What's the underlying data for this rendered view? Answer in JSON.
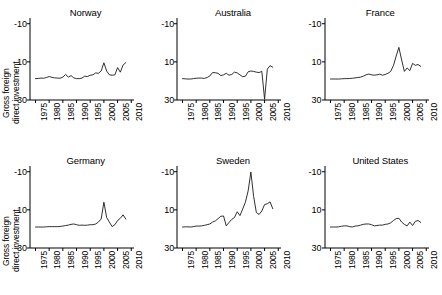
{
  "figure": {
    "ylabel_line1": "Gross foreign",
    "ylabel_line2": "direct investment",
    "ytick_labels": [
      "30",
      "10",
      "-10"
    ],
    "xtick_labels": [
      "1975",
      "1980",
      "1985",
      "1990",
      "1995",
      "2000",
      "2005",
      "2010"
    ],
    "line_color": "#1a1a1a",
    "axis_color": "#000000"
  },
  "chart_data": {
    "type": "line",
    "title": "",
    "xlabel": "",
    "ylabel": "Gross foreign direct investment",
    "xlim": [
      1973,
      2011
    ],
    "ylim": [
      -10,
      33
    ],
    "yticks": [
      -10,
      10,
      30
    ],
    "xticks": [
      1975,
      1980,
      1985,
      1990,
      1995,
      2000,
      2005,
      2010
    ],
    "grid": false,
    "legend": "none",
    "layout": "2 rows x 3 columns small multiples",
    "x": [
      1975,
      1976,
      1977,
      1978,
      1979,
      1980,
      1981,
      1982,
      1983,
      1984,
      1985,
      1986,
      1987,
      1988,
      1989,
      1990,
      1991,
      1992,
      1993,
      1994,
      1995,
      1996,
      1997,
      1998,
      1999,
      2000,
      2001,
      2002,
      2003,
      2004,
      2005,
      2006,
      2007,
      2008
    ],
    "series": [
      {
        "name": "Norway",
        "panel": 1,
        "values": [
          1.2,
          1.3,
          1.5,
          1.4,
          1.8,
          2.3,
          1.9,
          1.6,
          1.5,
          1.4,
          2.0,
          3.4,
          2.0,
          2.8,
          1.6,
          1.2,
          1.2,
          1.5,
          2.5,
          2.3,
          3.0,
          3.2,
          4.2,
          4.0,
          5.2,
          9.5,
          5.2,
          3.2,
          3.0,
          3.2,
          7.0,
          4.6,
          8.3,
          9.6
        ]
      },
      {
        "name": "Australia",
        "panel": 2,
        "values": [
          1.2,
          1.1,
          1.0,
          1.0,
          1.2,
          1.4,
          1.5,
          1.5,
          1.3,
          1.8,
          2.6,
          4.4,
          4.3,
          4.0,
          2.8,
          3.2,
          4.0,
          3.0,
          3.4,
          4.6,
          4.2,
          3.2,
          2.2,
          2.5,
          4.8,
          5.2,
          5.0,
          4.6,
          4.4,
          5.0,
          -9.6,
          6.2,
          8.0,
          7.2
        ]
      },
      {
        "name": "France",
        "panel": 3,
        "values": [
          1.0,
          1.0,
          1.0,
          1.0,
          1.1,
          1.2,
          1.2,
          1.3,
          1.4,
          1.6,
          1.8,
          2.0,
          2.5,
          3.2,
          3.6,
          3.2,
          3.0,
          3.2,
          3.6,
          3.0,
          3.4,
          4.0,
          5.0,
          8.0,
          13.0,
          17.6,
          11.0,
          5.0,
          6.8,
          5.4,
          9.2,
          8.2,
          8.6,
          7.6
        ]
      },
      {
        "name": "Germany",
        "panel": 4,
        "values": [
          1.0,
          1.0,
          1.0,
          1.0,
          1.1,
          1.2,
          1.2,
          1.2,
          1.2,
          1.3,
          1.5,
          1.8,
          2.0,
          2.4,
          2.6,
          2.2,
          1.9,
          2.0,
          1.9,
          2.0,
          2.2,
          2.2,
          2.6,
          3.6,
          5.2,
          14.0,
          6.0,
          3.6,
          1.2,
          2.2,
          4.4,
          5.6,
          7.4,
          5.2
        ]
      },
      {
        "name": "Sweden",
        "panel": 5,
        "values": [
          1.0,
          1.1,
          1.1,
          1.0,
          1.2,
          1.5,
          1.5,
          1.6,
          1.9,
          2.2,
          2.6,
          3.6,
          4.2,
          5.4,
          6.6,
          6.8,
          1.6,
          3.4,
          5.0,
          6.0,
          9.0,
          7.0,
          10.4,
          14.0,
          20.0,
          29.8,
          17.0,
          8.6,
          7.6,
          9.4,
          12.8,
          13.2,
          14.2,
          10.6
        ]
      },
      {
        "name": "United States",
        "panel": 6,
        "values": [
          1.0,
          1.0,
          1.0,
          1.1,
          1.4,
          1.6,
          1.6,
          1.2,
          1.0,
          1.5,
          1.6,
          2.0,
          2.4,
          2.6,
          2.6,
          2.2,
          1.6,
          1.8,
          2.0,
          2.0,
          2.4,
          2.6,
          3.2,
          4.4,
          5.4,
          5.6,
          3.6,
          2.4,
          1.6,
          3.6,
          1.8,
          4.0,
          4.4,
          3.4
        ]
      }
    ]
  },
  "panels": [
    {
      "title": "Norway"
    },
    {
      "title": "Australia"
    },
    {
      "title": "France"
    },
    {
      "title": "Germany"
    },
    {
      "title": "Sweden"
    },
    {
      "title": "United States"
    }
  ]
}
